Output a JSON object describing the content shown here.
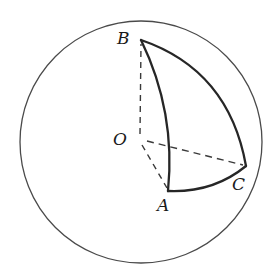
{
  "figure": {
    "background_color": "#ffffff",
    "stroke_color": "#262626",
    "sphere_outline_color": "#4a4a4a",
    "dashed_color": "#3a3a3a",
    "canvas": {
      "width": 280,
      "height": 279
    },
    "sphere": {
      "name": "sphere-outline",
      "center": {
        "x": 141,
        "y": 142
      },
      "radius": 121,
      "stroke_width": 1.2
    },
    "points": [
      {
        "id": "O",
        "label": "O",
        "x": 141,
        "y": 139,
        "role": "sphere-center"
      },
      {
        "id": "A",
        "label": "A",
        "x": 168,
        "y": 191,
        "role": "triangle-vertex"
      },
      {
        "id": "B",
        "label": "B",
        "x": 141,
        "y": 40,
        "role": "triangle-vertex"
      },
      {
        "id": "C",
        "label": "C",
        "x": 246,
        "y": 166,
        "role": "triangle-vertex"
      }
    ],
    "solid_arcs": [
      {
        "id": "arc-BA",
        "from": "B",
        "to": "A",
        "note": "great-circle arc bulging right"
      },
      {
        "id": "arc-BC",
        "from": "B",
        "to": "C",
        "note": "great-circle arc bulging up-right"
      },
      {
        "id": "arc-AC",
        "from": "A",
        "to": "C",
        "note": "great-circle arc bulging down"
      }
    ],
    "dashed_radii": [
      {
        "id": "radius-OB",
        "from": "O",
        "to": "B"
      },
      {
        "id": "radius-OA",
        "from": "O",
        "to": "A"
      },
      {
        "id": "radius-OC",
        "from": "O",
        "to": "C"
      }
    ],
    "labels": {
      "A": "A",
      "B": "B",
      "C": "C",
      "O": "O"
    }
  }
}
